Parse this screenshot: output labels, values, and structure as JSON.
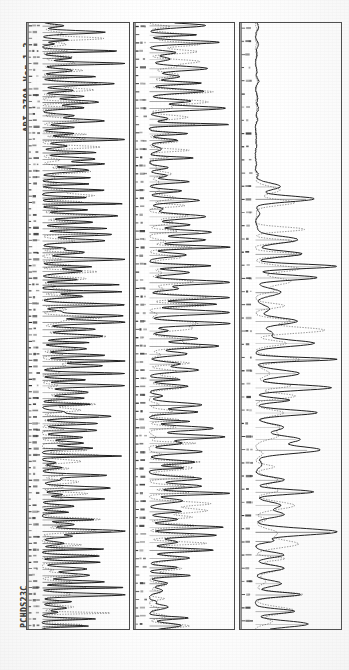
{
  "document": {
    "title": "ABI 370A Ver 1.3",
    "sample_label": "PCHDS23C",
    "orientation": "rotated-90-ccw",
    "background_color": "#ffffff",
    "ink_color": "#1a1a1a"
  },
  "panels": [
    {
      "name": "panel-1",
      "index": 1
    },
    {
      "name": "panel-2",
      "index": 2
    },
    {
      "name": "panel-3",
      "index": 3
    }
  ],
  "chart_data": {
    "type": "line",
    "title": "ABI 370A Ver 1.3",
    "subtitle": "PCHDS23C",
    "xlabel": "",
    "ylabel": "",
    "grid": false,
    "legend": "none",
    "orientation": "vertical-traces-rotated-90",
    "axis": {
      "trace_axis_label": "intensity",
      "scan_axis_label": "base position",
      "xlim": [
        0,
        100
      ],
      "ylim": [
        0,
        608
      ]
    },
    "panels": [
      {
        "panel": 1,
        "name": "panel-1",
        "series": [
          {
            "name": "trace-A",
            "style": "solid",
            "color": "#151515"
          },
          {
            "name": "trace-C",
            "style": "dotted",
            "color": "#5c5c5c"
          }
        ],
        "peak_count": 96,
        "baseline": 4,
        "peak_amplitude_range": [
          18,
          92
        ],
        "notes": "Dense early-run region: tall closely spaced peaks spanning the full panel height with a strong solid envelope along the right margin."
      },
      {
        "panel": 2,
        "name": "panel-2",
        "series": [
          {
            "name": "trace-G",
            "style": "solid",
            "color": "#151515"
          },
          {
            "name": "trace-T",
            "style": "dotted",
            "color": "#5c5c5c"
          }
        ],
        "peak_count": 74,
        "baseline": 4,
        "peak_amplitude_range": [
          10,
          88
        ],
        "notes": "Mid-run region: sparser, sharper peaks with wider flat baseline stretches between clusters."
      },
      {
        "panel": 3,
        "name": "panel-3",
        "series": [
          {
            "name": "trace-A",
            "style": "solid",
            "color": "#151515"
          },
          {
            "name": "trace-C",
            "style": "dotted",
            "color": "#5c5c5c"
          }
        ],
        "peak_count": 46,
        "baseline": 4,
        "peak_amplitude_range": [
          8,
          96
        ],
        "notes": "Late-run region: long flat baseline in the upper third, an abrupt saturated shoulder near the top, then broad resolved peaks through the lower two thirds."
      }
    ]
  }
}
